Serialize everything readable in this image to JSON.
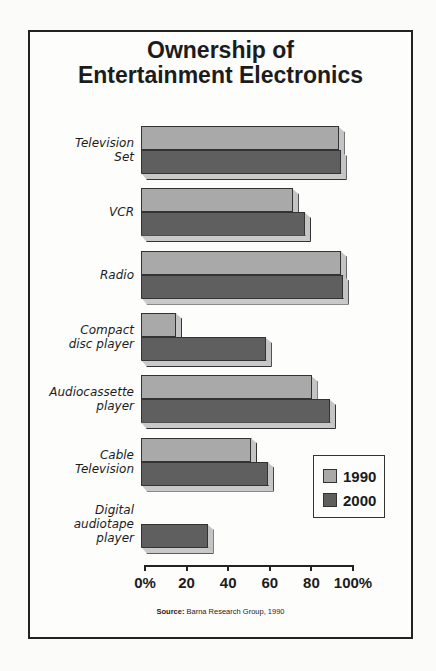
{
  "chart_data": {
    "type": "bar",
    "orientation": "horizontal",
    "style": "3d",
    "title": "Ownership of Entertainment Electronics",
    "title_lines": [
      "Ownership of",
      "Entertainment Electronics"
    ],
    "categories": [
      "Television Set",
      "VCR",
      "Radio",
      "Compact disc player",
      "Audiocassette player",
      "Cable Television",
      "Digital audiotape player"
    ],
    "category_lines": [
      [
        "Television",
        "Set"
      ],
      [
        "VCR"
      ],
      [
        "Radio"
      ],
      [
        "Compact",
        "disc player"
      ],
      [
        "Audiocassette",
        "player"
      ],
      [
        "Cable",
        "Television"
      ],
      [
        "Digital",
        "audiotape",
        "player"
      ]
    ],
    "series": [
      {
        "name": "1990",
        "color": "#a9a9a9",
        "values": [
          95,
          73,
          96,
          17,
          82,
          53,
          null
        ]
      },
      {
        "name": "2000",
        "color": "#5f5f5f",
        "values": [
          96,
          79,
          97,
          60,
          91,
          61,
          32
        ]
      }
    ],
    "xlabel": "",
    "ylabel": "",
    "xlim": [
      0,
      100
    ],
    "x_ticks": [
      "0%",
      "20",
      "40",
      "60",
      "80",
      "100%"
    ],
    "grid": false,
    "legend_position": "lower right",
    "legend": [
      "1990",
      "2000"
    ],
    "source_label": "Source:",
    "source_text": "Barna Research Group, 1990"
  }
}
